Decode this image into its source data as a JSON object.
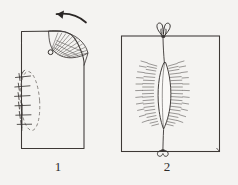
{
  "plate": {
    "background_color": "#f4f3f1",
    "ink_color": "#3b3735",
    "width": 238,
    "height": 185
  },
  "panels": [
    {
      "caption": "1",
      "name": "panel-one-flap-rotation",
      "description": "Rectangular skin field with rounded excised upper-right corner, a fan shaped hatched rotation flap pivoting at a point, a curved arrow indicating counter-clockwise rotation, and a dashed elliptical donor defect closed with interrupted sutures on the left margin.",
      "elements": {
        "field_outline": "rectangle-with-cut-corner",
        "rotation_arrow": "curved-arrow-left",
        "flap": "fan-shaped-hatched-flap",
        "pivot_point": "small-circle",
        "donor_ellipse": "dashed-ellipse",
        "suture_count": 6
      }
    },
    {
      "caption": "2",
      "name": "panel-two-closed-wound",
      "description": "Rectangular skin field with a central lens shaped closed wound, radiating hatch marks on both sides representing tension lines, and tied knots at the superior and inferior apices.",
      "elements": {
        "field_outline": "rectangle",
        "wound": "lens-shaped-closure",
        "top_knot": "bow-knot",
        "bottom_knot": "loop-knot",
        "hatch_rows_left": 11,
        "hatch_rows_right": 11
      }
    }
  ]
}
